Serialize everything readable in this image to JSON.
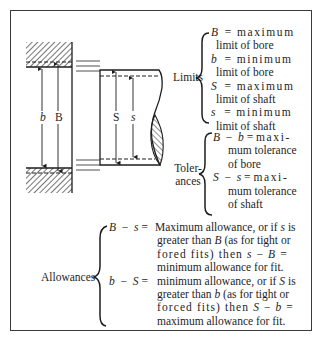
{
  "diagram": {
    "type": "engineering-fit-diagram",
    "drawing": {
      "labels": {
        "bore_min": "b",
        "bore_max": "B",
        "shaft_max": "S",
        "shaft_min": "s"
      }
    },
    "limits": {
      "label": "Limits",
      "items": [
        {
          "symbol": "B",
          "eq": "=",
          "first": "maximum",
          "rest": "limit of bore"
        },
        {
          "symbol": "b",
          "eq": "=",
          "first": "minimum",
          "rest": "limit of bore"
        },
        {
          "symbol": "S",
          "eq": "=",
          "first": "maximum",
          "rest": "limit of shaft"
        },
        {
          "symbol": "s",
          "eq": "=",
          "first": "minimum",
          "rest": "limit of shaft"
        }
      ]
    },
    "tolerances": {
      "label_line1": "Toler-",
      "label_line2": "ances",
      "items": [
        {
          "expr_a": "B",
          "op": "−",
          "expr_b": "b",
          "eq": "=",
          "first": "maxi-",
          "line2": "mum tolerance",
          "line3": "of bore"
        },
        {
          "expr_a": "S",
          "op": "−",
          "expr_b": "s",
          "eq": "=",
          "first": "maxi-",
          "line2": "mum tolerance",
          "line3": "of shaft"
        }
      ]
    },
    "allowances": {
      "label": "Allowances",
      "items": [
        {
          "expr_a": "B",
          "op": "−",
          "expr_b": "s",
          "eq": "=",
          "line1_pre": "Maximum allowance, or if ",
          "line1_var": "s",
          "line1_post": " is",
          "line2_pre": "greater than ",
          "line2_var": "B",
          "line2_post": " (as for tight or",
          "line3_pre": "fored fits) then ",
          "line3_var_a": "s",
          "line3_op": " − ",
          "line3_var_b": "B",
          "line3_post": " =",
          "line4": "minimum allowance for fit."
        },
        {
          "expr_a": "b",
          "op": "−",
          "expr_b": "S",
          "eq": "=",
          "line1_pre": "minimum allowance, or if ",
          "line1_var": "S",
          "line1_post": " is",
          "line2_pre": "greater than ",
          "line2_var": "b",
          "line2_post": " (as for tight or",
          "line3_pre": "forced fits) then ",
          "line3_var_a": "S",
          "line3_op": " − ",
          "line3_var_b": "b",
          "line3_post": " =",
          "line4": "maximum allowance for fit."
        }
      ]
    }
  }
}
